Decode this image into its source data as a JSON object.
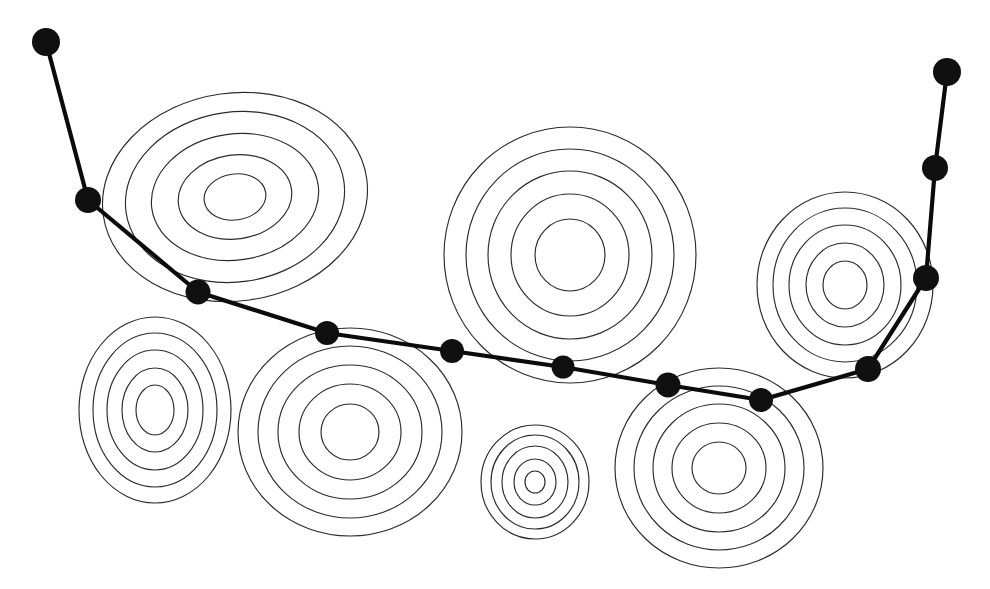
{
  "figure": {
    "type": "contour-path-diagram",
    "width": 990,
    "height": 589,
    "background_color": "#ffffff",
    "contour_stroke_color": "#2b2b2b",
    "path_stroke_color": "#0b0b0b",
    "node_fill_color": "#101010"
  },
  "chart_data": {
    "type": "line",
    "xlabel": "",
    "ylabel": "",
    "grid": false,
    "legend": "none",
    "xlim": [
      0,
      990
    ],
    "ylim": [
      0,
      589
    ],
    "series": [
      {
        "name": "descent-path",
        "marker": "filled-circle",
        "x": [
          46,
          88,
          198,
          327,
          452,
          563,
          668,
          761,
          868,
          926,
          935,
          947
        ],
        "y": [
          42,
          200,
          292,
          333,
          351,
          367,
          385,
          400,
          369,
          278,
          168,
          72
        ]
      }
    ],
    "annotations": [
      {
        "label": "basin-1",
        "cx": 235,
        "cy": 197,
        "rings": 5
      },
      {
        "label": "basin-2",
        "cx": 570,
        "cy": 255,
        "rings": 5
      },
      {
        "label": "basin-3",
        "cx": 845,
        "cy": 285,
        "rings": 5
      },
      {
        "label": "basin-4",
        "cx": 155,
        "cy": 410,
        "rings": 5
      },
      {
        "label": "basin-5",
        "cx": 350,
        "cy": 432,
        "rings": 5
      },
      {
        "label": "basin-6",
        "cx": 535,
        "cy": 482,
        "rings": 4
      },
      {
        "label": "basin-7",
        "cx": 719,
        "cy": 468,
        "rings": 5
      }
    ]
  },
  "path_nodes": [
    {
      "id": "node-1",
      "cx": 46,
      "cy": 42,
      "r": 14
    },
    {
      "id": "node-2",
      "cx": 88,
      "cy": 200,
      "r": 13
    },
    {
      "id": "node-3",
      "cx": 198,
      "cy": 292,
      "r": 12.5
    },
    {
      "id": "node-4",
      "cx": 327,
      "cy": 333,
      "r": 12
    },
    {
      "id": "node-5",
      "cx": 452,
      "cy": 351,
      "r": 12
    },
    {
      "id": "node-6",
      "cx": 563,
      "cy": 367,
      "r": 11.5
    },
    {
      "id": "node-7",
      "cx": 668,
      "cy": 385,
      "r": 12.5
    },
    {
      "id": "node-8",
      "cx": 761,
      "cy": 400,
      "r": 12
    },
    {
      "id": "node-9",
      "cx": 868,
      "cy": 369,
      "r": 13
    },
    {
      "id": "node-10",
      "cx": 926,
      "cy": 278,
      "r": 13
    },
    {
      "id": "node-11",
      "cx": 935,
      "cy": 168,
      "r": 13
    },
    {
      "id": "node-12",
      "cx": 947,
      "cy": 72,
      "r": 14
    }
  ],
  "contour_groups": [
    {
      "id": "basin-1",
      "cx": 235,
      "cy": 197,
      "rotation": -8,
      "rings": [
        {
          "rx": 133,
          "ry": 104
        },
        {
          "rx": 110,
          "ry": 85
        },
        {
          "rx": 84,
          "ry": 63
        },
        {
          "rx": 57,
          "ry": 42
        },
        {
          "rx": 31,
          "ry": 23
        }
      ]
    },
    {
      "id": "basin-2",
      "cx": 570,
      "cy": 255,
      "rotation": 0,
      "rings": [
        {
          "rx": 126,
          "ry": 128
        },
        {
          "rx": 104,
          "ry": 106
        },
        {
          "rx": 82,
          "ry": 84
        },
        {
          "rx": 59,
          "ry": 61
        },
        {
          "rx": 35,
          "ry": 36
        }
      ]
    },
    {
      "id": "basin-3",
      "cx": 845,
      "cy": 285,
      "rotation": 0,
      "rings": [
        {
          "rx": 88,
          "ry": 93
        },
        {
          "rx": 72,
          "ry": 77
        },
        {
          "rx": 56,
          "ry": 60
        },
        {
          "rx": 39,
          "ry": 42
        },
        {
          "rx": 22,
          "ry": 24
        }
      ]
    },
    {
      "id": "basin-4",
      "cx": 155,
      "cy": 410,
      "rotation": 0,
      "rings": [
        {
          "rx": 76,
          "ry": 93
        },
        {
          "rx": 62,
          "ry": 77
        },
        {
          "rx": 48,
          "ry": 60
        },
        {
          "rx": 33,
          "ry": 42
        },
        {
          "rx": 19,
          "ry": 25
        }
      ]
    },
    {
      "id": "basin-5",
      "cx": 350,
      "cy": 432,
      "rotation": 0,
      "rings": [
        {
          "rx": 112,
          "ry": 104
        },
        {
          "rx": 92,
          "ry": 86
        },
        {
          "rx": 72,
          "ry": 67
        },
        {
          "rx": 51,
          "ry": 48
        },
        {
          "rx": 29,
          "ry": 28
        }
      ]
    },
    {
      "id": "basin-6",
      "cx": 535,
      "cy": 482,
      "rotation": 0,
      "rings": [
        {
          "rx": 54,
          "ry": 57
        },
        {
          "rx": 44,
          "ry": 47
        },
        {
          "rx": 33,
          "ry": 36
        },
        {
          "rx": 21,
          "ry": 23
        },
        {
          "rx": 10,
          "ry": 11
        }
      ]
    },
    {
      "id": "basin-7",
      "cx": 719,
      "cy": 468,
      "rotation": 0,
      "rings": [
        {
          "rx": 104,
          "ry": 100
        },
        {
          "rx": 85,
          "ry": 82
        },
        {
          "rx": 66,
          "ry": 64
        },
        {
          "rx": 47,
          "ry": 45
        },
        {
          "rx": 27,
          "ry": 26
        }
      ]
    }
  ]
}
